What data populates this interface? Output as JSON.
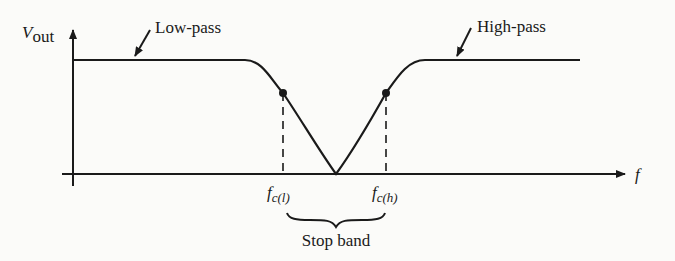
{
  "diagram": {
    "y_axis": {
      "symbol": "V",
      "subscript": "out"
    },
    "x_axis": {
      "symbol": "f"
    },
    "annotations": {
      "low_pass": "Low-pass",
      "high_pass": "High-pass",
      "stop_band": "Stop band"
    },
    "cutoffs": [
      {
        "symbol": "f",
        "subscript": "c(l)"
      },
      {
        "symbol": "f",
        "subscript": "c(h)"
      }
    ],
    "colors": {
      "ink": "#1a1a1a",
      "background": "#fbfbf9"
    }
  }
}
